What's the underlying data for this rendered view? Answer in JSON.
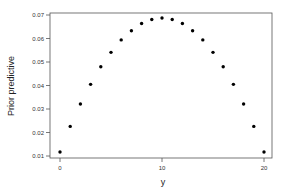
{
  "chart_data": {
    "type": "scatter",
    "title": "",
    "xlabel": "y",
    "ylabel": "Prior predictive",
    "x": [
      0,
      1,
      2,
      3,
      4,
      5,
      6,
      7,
      8,
      9,
      10,
      11,
      12,
      13,
      14,
      15,
      16,
      17,
      18,
      19,
      20
    ],
    "values": [
      0.0117,
      0.0226,
      0.0321,
      0.0405,
      0.048,
      0.0541,
      0.0594,
      0.0633,
      0.0664,
      0.0681,
      0.0687,
      0.0681,
      0.0664,
      0.0633,
      0.0594,
      0.0541,
      0.048,
      0.0405,
      0.0321,
      0.0226,
      0.0117
    ],
    "xlim": [
      -1,
      21
    ],
    "ylim": [
      0.01,
      0.07
    ],
    "x_ticks": [
      "0",
      "10",
      "20"
    ],
    "y_ticks": [
      "0.01",
      "0.02",
      "0.03",
      "0.04",
      "0.05",
      "0.06",
      "0.07"
    ],
    "grid": false,
    "legend": null,
    "marker_color": "#000000"
  },
  "axes": {
    "xlabel": "y",
    "ylabel": "Prior predictive"
  }
}
